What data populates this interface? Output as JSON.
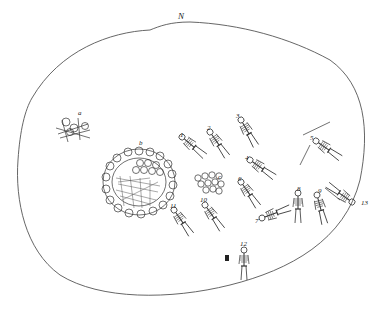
{
  "figure": {
    "north_label": "N",
    "labels": {
      "a": "a",
      "b": "b",
      "c": "c",
      "n1": "1",
      "n2": "2",
      "n3": "3",
      "n4": "4",
      "n5": "5",
      "n6": "6",
      "n7": "7",
      "n8": "8",
      "n9": "9",
      "n10": "10",
      "n11": "11",
      "n12": "12",
      "n13": "13"
    },
    "colors": {
      "ink": "#333333",
      "paper": "#ffffff"
    }
  }
}
